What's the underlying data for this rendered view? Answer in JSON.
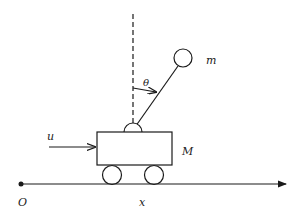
{
  "diagram": {
    "labels": {
      "pendulum_mass": "m",
      "angle": "θ",
      "force": "u",
      "cart_mass": "M",
      "origin": "O",
      "axis": "x"
    },
    "colors": {
      "stroke": "#1a1a1a",
      "background": "#ffffff"
    }
  }
}
